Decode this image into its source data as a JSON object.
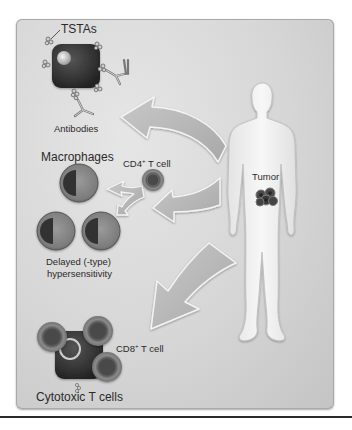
{
  "figure": {
    "labels": {
      "tstas": "TSTAs",
      "antibodies": "Antibodies",
      "macrophages": "Macrophages",
      "cd4_prefix": "CD4",
      "cd4_sup": "+",
      "cd4_suffix": " T cell",
      "delayed_line1": "Delayed (-type)",
      "delayed_line2": "hypersensitivity",
      "tumor": "Tumor",
      "cd8_prefix": "CD8",
      "cd8_sup": "+",
      "cd8_suffix": " T cell",
      "cytotoxic": "Cytotoxic T cells"
    },
    "colors": {
      "panel_bg": "#d6d6d6",
      "arrow_fill": "#b8b8b8",
      "arrow_stroke": "#f2f2f2",
      "tumor_cell": "#3a3a3a",
      "body_fill": "#f0f0f0",
      "macrophage_outer": "#8a8a8a",
      "macrophage_nucleus": "#3c3c3c",
      "text": "#2a2a2a"
    },
    "arrows": [
      {
        "from": "tumor",
        "to": "antibodies"
      },
      {
        "from": "tumor",
        "to": "cd4-t-cell"
      },
      {
        "from": "cd4-t-cell",
        "to": "macrophages"
      },
      {
        "from": "tumor",
        "to": "cytotoxic-t-cells"
      }
    ]
  }
}
